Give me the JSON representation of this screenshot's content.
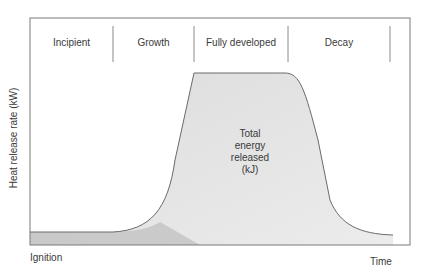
{
  "diagram": {
    "y_axis_label": "Heat release rate (kW)",
    "x_axis_start_label": "Ignition",
    "x_axis_end_label": "Time",
    "phases": [
      {
        "label": "Incipient"
      },
      {
        "label": "Growth"
      },
      {
        "label": "Fully developed"
      },
      {
        "label": "Decay"
      }
    ],
    "area_label_lines": [
      "Total",
      "energy",
      "released",
      "(kJ)"
    ],
    "colors": {
      "frame": "#7a7a7a",
      "curve": "#6a6a6a",
      "fill": "#e2e2e2",
      "baseline_band": "#b5b5b5",
      "divider": "#8a8a8a"
    }
  }
}
